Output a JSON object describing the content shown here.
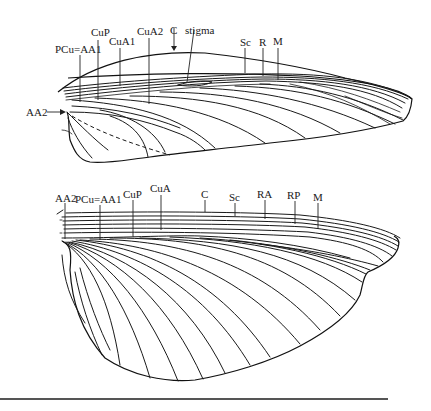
{
  "figure": {
    "forewing": {
      "labels": {
        "pcu_aa1": "PCu=AA1",
        "cup": "CuP",
        "cua1": "CuA1",
        "cua2": "CuA2",
        "c": "C",
        "stigma": "stigma",
        "sc": "Sc",
        "r": "R",
        "m": "M",
        "aa2": "AA2"
      }
    },
    "hindwing": {
      "labels": {
        "aa2": "AA2",
        "pcu_aa1": "PCu=AA1",
        "cup": "CuP",
        "cua": "CuA",
        "c": "C",
        "sc": "Sc",
        "ra": "RA",
        "rp": "RP",
        "m": "M"
      }
    },
    "colors": {
      "line": "#1a1a1a",
      "rule": "#555555",
      "background": "#ffffff"
    }
  }
}
